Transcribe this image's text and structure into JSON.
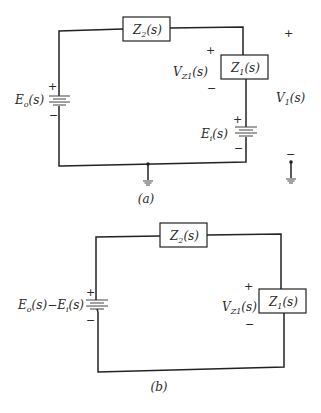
{
  "figure_a": {
    "caption": "(a)",
    "z2_label": "Z",
    "z2_sub": "2",
    "z2_arg": "(s)",
    "z1_label": "Z",
    "z1_sub": "1",
    "z1_arg": "(s)",
    "vz1_label": "V",
    "vz1_sub": "Z1",
    "vz1_arg": "(s)",
    "vz1_plus": "+",
    "vz1_minus": "−",
    "eo_label": "E",
    "eo_sub": "o",
    "eo_arg": "(s)",
    "eo_plus": "+",
    "eo_minus": "−",
    "ei_label": "E",
    "ei_sub": "i",
    "ei_arg": "(s)",
    "ei_plus": "+",
    "ei_minus": "−",
    "v1_label": "V",
    "v1_sub": "1",
    "v1_arg": "(s)",
    "v1_plus": "+",
    "v1_minus": "−",
    "ground_icon": "ground-icon"
  },
  "figure_b": {
    "caption": "(b)",
    "z2_label": "Z",
    "z2_sub": "2",
    "z2_arg": "(s)",
    "z1_label": "Z",
    "z1_sub": "1",
    "z1_arg": "(s)",
    "vz1_label": "V",
    "vz1_sub": "Z1",
    "vz1_arg": "(s)",
    "vz1_plus": "+",
    "vz1_minus": "−",
    "src_label_1": "E",
    "src_sub_1": "o",
    "src_arg_1": "(s)",
    "src_sep": "−",
    "src_label_2": "E",
    "src_sub_2": "i",
    "src_arg_2": "(s)",
    "src_plus": "+",
    "src_minus": "−"
  }
}
